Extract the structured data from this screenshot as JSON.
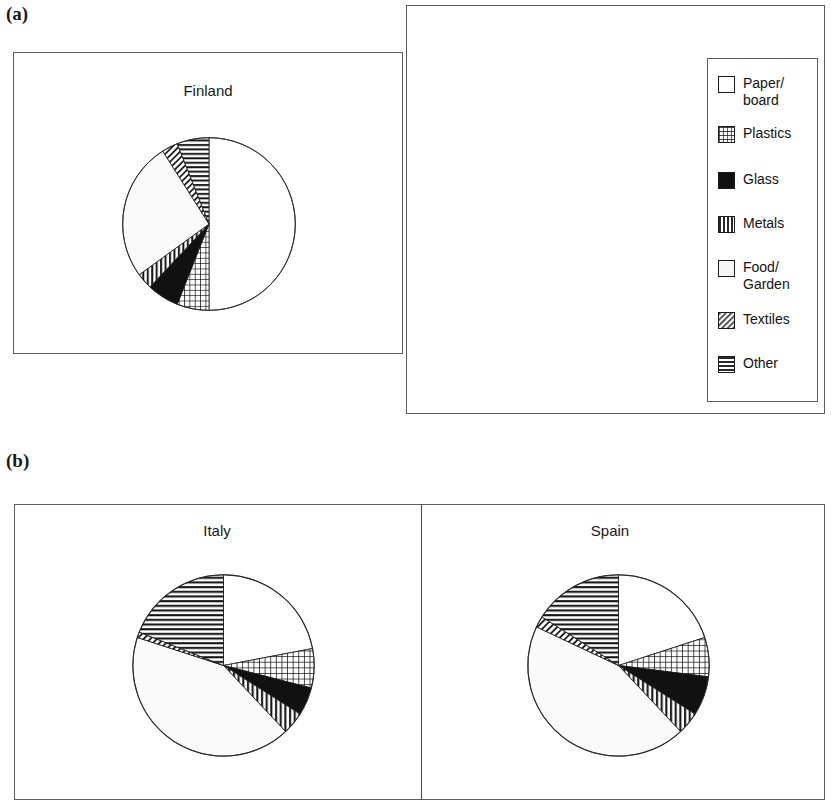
{
  "figure": {
    "panel_a_label": "(a)",
    "panel_b_label": "(b)"
  },
  "legend": {
    "title": "",
    "items": [
      {
        "label": "Paper/\nboard",
        "pattern": "white",
        "color": "#ffffff"
      },
      {
        "label": "Plastics",
        "pattern": "grid",
        "color": "#2b2b2b"
      },
      {
        "label": "Glass",
        "pattern": "solid-black",
        "color": "#111111"
      },
      {
        "label": "Metals",
        "pattern": "vertical-bars",
        "color": "#1a1a1a"
      },
      {
        "label": "Food/\nGarden",
        "pattern": "very-light",
        "color": "#f2f2f2"
      },
      {
        "label": "Textiles",
        "pattern": "diagonal",
        "color": "#555555"
      },
      {
        "label": "Other",
        "pattern": "horizontal-lines",
        "color": "#1a1a1a"
      }
    ]
  },
  "chart_data": [
    {
      "type": "pie",
      "title": "Finland",
      "panel": "(a)",
      "categories": [
        "Paper/board",
        "Plastics",
        "Glass",
        "Metals",
        "Food/Garden",
        "Textiles",
        "Other"
      ],
      "values": [
        50,
        6,
        6,
        3,
        26,
        3,
        6
      ],
      "start_angle": 0,
      "direction": "clockwise"
    },
    {
      "type": "pie",
      "title": "UK",
      "panel": "(a)",
      "categories": [
        "Paper/board",
        "Plastics",
        "Glass",
        "Metals",
        "Food/Garden",
        "Textiles",
        "Other"
      ],
      "values": [
        28,
        11,
        8,
        7,
        20,
        5,
        21
      ],
      "start_angle": 0,
      "direction": "clockwise"
    },
    {
      "type": "pie",
      "title": "Italy",
      "panel": "(b)",
      "categories": [
        "Paper/board",
        "Plastics",
        "Glass",
        "Metals",
        "Food/Garden",
        "Textiles",
        "Other"
      ],
      "values": [
        22,
        7,
        5,
        4,
        42,
        1,
        19
      ],
      "start_angle": 0,
      "direction": "clockwise"
    },
    {
      "type": "pie",
      "title": "Spain",
      "panel": "(b)",
      "categories": [
        "Paper/board",
        "Plastics",
        "Glass",
        "Metals",
        "Food/Garden",
        "Textiles",
        "Other"
      ],
      "values": [
        20,
        7,
        7,
        4,
        44,
        2,
        16
      ],
      "start_angle": 0,
      "direction": "clockwise"
    }
  ]
}
